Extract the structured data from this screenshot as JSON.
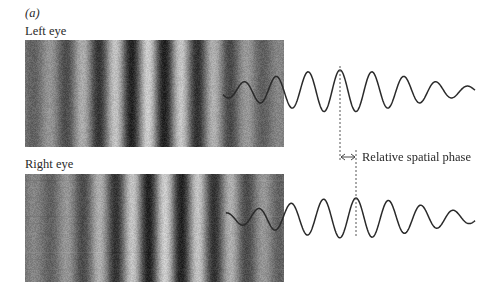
{
  "figure": {
    "panel_label": "(a)",
    "left_eye": {
      "label": "Left eye",
      "image": {
        "x": 25,
        "y": 40,
        "width": 259,
        "height": 107
      },
      "grating_period_px": 33,
      "grating_phase_dark_x": 65,
      "envelope_center_x": 150,
      "envelope_sigma_px": 70,
      "wave": {
        "start_x": 223,
        "end_x": 475,
        "center_y": 91,
        "period_px": 32,
        "peak_x": 340,
        "amplitude_px": 21,
        "envelope_center_x": 340,
        "envelope_sigma_px": 75
      }
    },
    "right_eye": {
      "label": "Right eye",
      "image": {
        "x": 25,
        "y": 174,
        "width": 259,
        "height": 108
      },
      "grating_period_px": 33,
      "grating_phase_dark_x": 82,
      "envelope_center_x": 165,
      "envelope_sigma_px": 70,
      "wave": {
        "start_x": 226,
        "end_x": 475,
        "center_y": 218,
        "period_px": 32.5,
        "peak_x": 356,
        "amplitude_px": 20,
        "envelope_center_x": 350,
        "envelope_sigma_px": 75
      }
    },
    "phase_marker": {
      "left_dashed_x": 340,
      "left_dashed_y1": 66,
      "left_dashed_y2": 160,
      "right_dashed_x": 356,
      "right_dashed_y1": 150,
      "right_dashed_y2": 236,
      "arrow_y": 157,
      "label": "Relative spatial phase"
    },
    "colors": {
      "ink": "#2a2a2a",
      "grating_mean": "#7a7a7a",
      "dashed": "#555555"
    }
  }
}
